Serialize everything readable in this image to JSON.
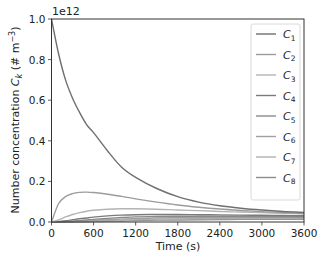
{
  "chart_data": {
    "type": "line",
    "title": "",
    "xlabel": "Time (s)",
    "ylabel": "Number concentration C_k (# m^-3)",
    "ylabel_parts": {
      "main": "Number concentration ",
      "var": "C",
      "sub": "k",
      "unit": " (# m",
      "exp": "−3",
      "close": ")"
    },
    "y_offset_label": "1e12",
    "xlim": [
      0,
      3600
    ],
    "ylim": [
      0,
      1.0
    ],
    "xticks": [
      0,
      600,
      1200,
      1800,
      2400,
      3000,
      3600
    ],
    "yticks": [
      0.0,
      0.2,
      0.4,
      0.6,
      0.8,
      1.0
    ],
    "ytick_labels": [
      "0.0",
      "0.2",
      "0.4",
      "0.6",
      "0.8",
      "1.0"
    ],
    "grid": false,
    "legend_position": "upper right",
    "x": [
      0,
      100,
      200,
      300,
      400,
      500,
      600,
      800,
      1000,
      1200,
      1500,
      1800,
      2100,
      2400,
      2700,
      3000,
      3300,
      3600
    ],
    "series": [
      {
        "name": "C1",
        "sub": "1",
        "color": "#6f6f6f",
        "values": [
          1.0,
          0.83,
          0.7,
          0.61,
          0.54,
          0.48,
          0.44,
          0.35,
          0.27,
          0.22,
          0.165,
          0.125,
          0.098,
          0.08,
          0.068,
          0.059,
          0.052,
          0.047
        ]
      },
      {
        "name": "C2",
        "sub": "2",
        "color": "#9c9c9c",
        "values": [
          0.0,
          0.09,
          0.125,
          0.14,
          0.146,
          0.147,
          0.145,
          0.137,
          0.126,
          0.114,
          0.098,
          0.084,
          0.073,
          0.064,
          0.057,
          0.051,
          0.046,
          0.042
        ]
      },
      {
        "name": "C3",
        "sub": "3",
        "color": "#b4b4b4",
        "values": [
          0.0,
          0.01,
          0.025,
          0.037,
          0.046,
          0.053,
          0.058,
          0.063,
          0.065,
          0.065,
          0.063,
          0.059,
          0.056,
          0.052,
          0.049,
          0.046,
          0.043,
          0.04
        ]
      },
      {
        "name": "C4",
        "sub": "4",
        "color": "#7a7a7a",
        "values": [
          0.0,
          0.002,
          0.006,
          0.011,
          0.016,
          0.02,
          0.024,
          0.03,
          0.034,
          0.036,
          0.037,
          0.037,
          0.036,
          0.035,
          0.034,
          0.033,
          0.032,
          0.031
        ]
      },
      {
        "name": "C5",
        "sub": "5",
        "color": "#8a8a8a",
        "values": [
          0.0,
          0.0,
          0.002,
          0.004,
          0.007,
          0.01,
          0.013,
          0.018,
          0.022,
          0.025,
          0.027,
          0.028,
          0.028,
          0.028,
          0.028,
          0.027,
          0.027,
          0.026
        ]
      },
      {
        "name": "C6",
        "sub": "6",
        "color": "#a0a0a0",
        "values": [
          0.0,
          0.0,
          0.001,
          0.002,
          0.003,
          0.005,
          0.007,
          0.011,
          0.014,
          0.017,
          0.02,
          0.021,
          0.022,
          0.022,
          0.022,
          0.022,
          0.022,
          0.021
        ]
      },
      {
        "name": "C7",
        "sub": "7",
        "color": "#b0b0b0",
        "values": [
          0.0,
          0.0,
          0.0,
          0.001,
          0.001,
          0.002,
          0.003,
          0.006,
          0.008,
          0.011,
          0.013,
          0.015,
          0.016,
          0.017,
          0.017,
          0.017,
          0.017,
          0.017
        ]
      },
      {
        "name": "C8",
        "sub": "8",
        "color": "#8c8c8c",
        "values": [
          0.0,
          0.0,
          0.0,
          0.0,
          0.001,
          0.001,
          0.002,
          0.003,
          0.005,
          0.007,
          0.009,
          0.01,
          0.011,
          0.012,
          0.013,
          0.013,
          0.013,
          0.013
        ]
      }
    ]
  }
}
